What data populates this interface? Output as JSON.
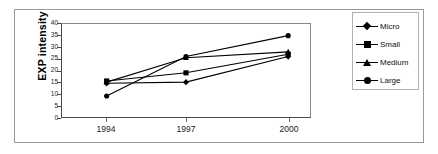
{
  "chart_data": {
    "type": "line",
    "title": "",
    "xlabel": "",
    "ylabel": "EXP intensity",
    "categories": [
      "1994",
      "1997",
      "2000"
    ],
    "x_tick_labels": [
      "1994",
      "1997",
      "2000"
    ],
    "y_tick_labels": [
      "0",
      "5",
      "10",
      "15",
      "20",
      "25",
      "30",
      "35",
      "40"
    ],
    "y_ticks": [
      0,
      5,
      10,
      15,
      20,
      25,
      30,
      35,
      40
    ],
    "ylim": [
      0,
      40
    ],
    "grid": false,
    "legend_position": "right",
    "series": [
      {
        "name": "Micro",
        "marker": "diamond",
        "values": [
          14.5,
          15.0,
          26.0
        ]
      },
      {
        "name": "Small",
        "marker": "square",
        "values": [
          15.5,
          19.0,
          27.0
        ]
      },
      {
        "name": "Medium",
        "marker": "triangle",
        "values": [
          15.0,
          25.5,
          28.0
        ]
      },
      {
        "name": "Large",
        "marker": "circle",
        "values": [
          9.0,
          26.0,
          35.0
        ]
      }
    ]
  },
  "legend": {
    "items": [
      {
        "label": "Micro",
        "marker": "diamond-marker-icon"
      },
      {
        "label": "Small",
        "marker": "square-marker-icon"
      },
      {
        "label": "Medium",
        "marker": "triangle-marker-icon"
      },
      {
        "label": "Large",
        "marker": "circle-marker-icon"
      }
    ]
  },
  "colors": {
    "series": "#000000",
    "axis": "#4a4a4a",
    "frame": "#9a9a9a",
    "background": "#ffffff"
  }
}
